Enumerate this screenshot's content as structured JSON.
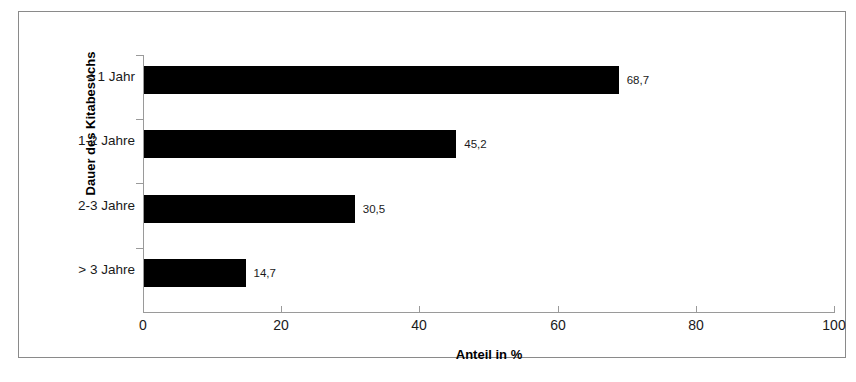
{
  "chart_data": {
    "type": "bar",
    "orientation": "horizontal",
    "title": "",
    "xlabel": "Anteil in %",
    "ylabel": "Dauer des Kitabesuchs",
    "categories": [
      "< 1 Jahr",
      "1-2 Jahre",
      "2-3 Jahre",
      "> 3 Jahre"
    ],
    "values": [
      68.7,
      45.2,
      30.5,
      14.7
    ],
    "value_labels": [
      "68,7",
      "45,2",
      "30,5",
      "14,7"
    ],
    "xlim": [
      0,
      100
    ],
    "xticks": [
      0,
      20,
      40,
      60,
      80,
      100
    ],
    "xtick_labels": [
      "0",
      "20",
      "40",
      "60",
      "80",
      "100"
    ],
    "grid": false,
    "legend": null,
    "bar_color": "#000000",
    "axis_color": "#9a9a9a",
    "frame_color": "#8a8a8a",
    "background": "#ffffff"
  }
}
